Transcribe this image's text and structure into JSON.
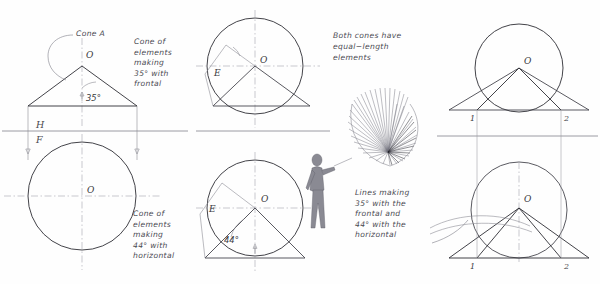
{
  "drawing": {
    "title": "Orthographic construction of cones of elements",
    "background_color": "#fefefe",
    "line_color": "#2e2e34",
    "annotation_color": "#4a4a52"
  },
  "reference_line": {
    "horizontal_label": "H",
    "frontal_label": "F"
  },
  "notes": {
    "cone_a": "Cone A",
    "cone_frontal": [
      "Cone of",
      "elements",
      "making",
      "35° with",
      "frontal"
    ],
    "cone_horizontal": [
      "Cone of",
      "elements",
      "making",
      "44° with",
      "horizontal"
    ],
    "equal_elements": [
      "Both cones have",
      "equal−length",
      "elements"
    ],
    "lines_making": [
      "Lines  making",
      "35° with  the",
      "frontal  and",
      "44° with  the",
      "horizontal"
    ]
  },
  "angles": {
    "frontal": "35°",
    "horizontal": "44°"
  },
  "point_labels": {
    "apex": "O",
    "element_end": "E",
    "one": "1",
    "two": "2"
  },
  "views": [
    {
      "name": "top-left-front-view",
      "position": "top-left",
      "apex_label": "O",
      "angle_label": "35°",
      "note": "Cone A",
      "shape": "triangle"
    },
    {
      "name": "bottom-left-top-view",
      "position": "bottom-left",
      "apex_label": "O",
      "shape": "circle"
    },
    {
      "name": "top-center-view",
      "position": "top-center",
      "apex_label": "O",
      "element_label": "E",
      "note": "Cone of elements making 35° with frontal",
      "shape": "circle-with-triangle"
    },
    {
      "name": "bottom-center-view",
      "position": "bottom-center",
      "apex_label": "O",
      "element_label": "E",
      "angle_label": "44°",
      "note": "Cone of elements making 44° with horizontal",
      "shape": "circle-with-triangle"
    },
    {
      "name": "top-right-view",
      "position": "top-right",
      "apex_label": "O",
      "points": [
        "1",
        "2"
      ],
      "shape": "circle-with-triangle"
    },
    {
      "name": "bottom-right-view",
      "position": "bottom-right",
      "apex_label": "O",
      "points": [
        "1",
        "2"
      ],
      "shape": "circle-with-triangle"
    }
  ],
  "pictorial": {
    "name": "figure-holding-cone",
    "description": "Human figure holding a fan of cone elements",
    "element_count": 34
  }
}
